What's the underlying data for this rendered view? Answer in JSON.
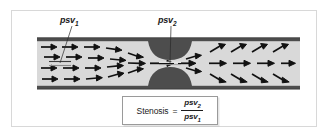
{
  "figure": {
    "frame_color": "#d8d8d8",
    "background": "#ffffff"
  },
  "labels": [
    {
      "id": "psv1",
      "text": "psv",
      "subscript": "1",
      "full_text": "psv1",
      "meaning": "peak systolic velocity proximal to stenosis",
      "x": 60,
      "y": 15,
      "leader_line": {
        "from_x": 72,
        "from_y": 26,
        "to_x": 60,
        "to_y": 62
      }
    },
    {
      "id": "psv2",
      "text": "psv",
      "subscript": "2",
      "full_text": "psv2",
      "meaning": "peak systolic velocity at stenosis",
      "x": 158,
      "y": 15,
      "leader_line": {
        "from_x": 170,
        "from_y": 26,
        "to_x": 170,
        "to_y": 62
      }
    }
  ],
  "vessel": {
    "left": 37,
    "right": 300,
    "top_wall_y": 38,
    "bottom_wall_y": 86,
    "wall_thickness": 3,
    "wall_color": "#4d4d4d",
    "lumen_color": "#d9d9d9",
    "plaque_color": "#4d4d4d",
    "plaque_center_x": 170,
    "plaque_radius": 22,
    "throat_half_height": 3
  },
  "flow": {
    "arrow_color": "#111111",
    "proximal_label": "laminar inflow arrows",
    "jet_label": "accelerated jet arrows",
    "distal_label": "diverging outflow arrows",
    "proximal_arrow_count": 16,
    "jet_arrow_count": 5,
    "distal_arrow_count": 12
  },
  "gates": [
    {
      "id": "gate-psv1",
      "x": 60,
      "y": 62,
      "width": 22,
      "label": "sample volume gate proximal"
    },
    {
      "id": "gate-psv2",
      "x": 170,
      "y": 62,
      "width": 22,
      "label": "sample volume gate at stenosis"
    }
  ],
  "formula": {
    "lhs": "Stenosis",
    "equals": "=",
    "numerator": "psv",
    "numerator_sub": "2",
    "denominator": "psv",
    "denominator_sub": "1",
    "full_text": "Stenosis = psv2 / psv1",
    "border_color": "#9a9a9a",
    "background": "#ffffff"
  }
}
